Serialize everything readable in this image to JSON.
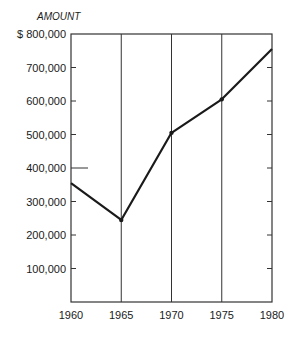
{
  "chart_data": {
    "type": "line",
    "title": "",
    "ylabel": "AMOUNT",
    "xlabel": "",
    "y_prefix": "$",
    "categories": [
      "1960",
      "1965",
      "1970",
      "1975",
      "1980"
    ],
    "values": [
      355000,
      245000,
      505000,
      605000,
      755000
    ],
    "y_ticks": [
      "$ 800,000",
      "700,000",
      "600,000",
      "500,000",
      "400,000",
      "300,000",
      "200,000",
      "100,000"
    ],
    "x_ticks": [
      "1960",
      "1965",
      "1970",
      "1975",
      "1980"
    ],
    "ylim": [
      0,
      800000
    ],
    "grid": "vertical lines at each x tick",
    "legend": "none",
    "colors": {
      "line": "#1a1a1a",
      "axes": "#333333"
    }
  }
}
